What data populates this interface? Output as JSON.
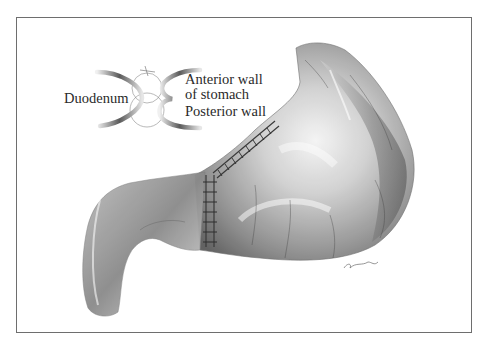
{
  "figure": {
    "inset_labels": {
      "left": "Duodenum",
      "right_top_line1": "Anterior wall",
      "right_top_line2": "of stomach",
      "right_bottom": "Posterior wall"
    },
    "signature": "artist signature",
    "colors": {
      "border": "#6e6e6e",
      "tissue_dark": "#4a4a4a",
      "tissue_mid": "#9a9a9a",
      "tissue_light": "#e8e8e8",
      "text": "#2a2a2a"
    }
  }
}
